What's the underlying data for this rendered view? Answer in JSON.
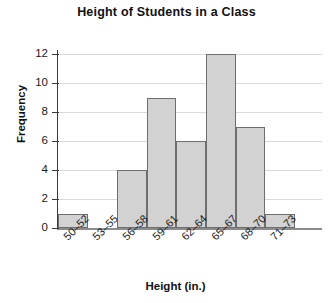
{
  "chart_data": {
    "type": "bar",
    "title": "Height of Students in a Class",
    "xlabel": "Height (in.)",
    "ylabel": "Frequency",
    "categories": [
      "50–52",
      "53–55",
      "56–58",
      "59–61",
      "62–64",
      "65–67",
      "68–70",
      "71–73"
    ],
    "values": [
      1,
      0,
      4,
      9,
      6,
      12,
      7,
      1
    ],
    "ylim": [
      0,
      13
    ],
    "yticks": [
      "0",
      "2",
      "4",
      "6",
      "8",
      "10",
      "12"
    ],
    "ytick_values": [
      0,
      2,
      4,
      6,
      8,
      10,
      12
    ],
    "grid": true,
    "legend": false,
    "bar_fill_color": "#d2d2d2",
    "bar_border_color": "#6e6e6e",
    "gridline_color": "#d9d9d9",
    "axis_color": "#3a3a3a"
  }
}
